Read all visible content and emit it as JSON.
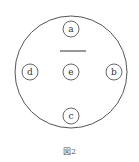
{
  "diagram": {
    "outer_circle": {
      "cx": 71,
      "cy": 72,
      "r": 56
    },
    "bar": {
      "x1": 60,
      "x2": 86,
      "y": 51
    },
    "nodes": [
      {
        "id": "a",
        "label": "a",
        "cx": 71,
        "cy": 29
      },
      {
        "id": "b",
        "label": "b",
        "cx": 114,
        "cy": 72
      },
      {
        "id": "c",
        "label": "c",
        "cx": 71,
        "cy": 116
      },
      {
        "id": "d",
        "label": "d",
        "cx": 30,
        "cy": 72
      },
      {
        "id": "e",
        "label": "e",
        "cx": 71,
        "cy": 72
      }
    ],
    "node_radius": 8,
    "stroke_color": "#555555"
  },
  "caption": "図2"
}
